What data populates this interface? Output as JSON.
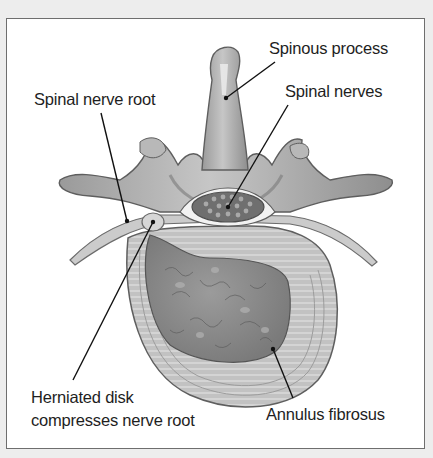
{
  "figure": {
    "labels": {
      "spinous_process": "Spinous process",
      "spinal_nerve_root": "Spinal nerve root",
      "spinal_nerves": "Spinal nerves",
      "herniated_disk_line1": "Herniated disk",
      "herniated_disk_line2": "compresses nerve root",
      "annulus_fibrosus": "Annulus fibrosus"
    }
  },
  "colors": {
    "background": "#ededed",
    "frame_fill": "#ffffff",
    "frame_border": "#6e6e6e",
    "bone": "#a8a8a8",
    "bone_light": "#cfcfcf",
    "disk_nucleus": "#8a8a8a",
    "annulus": "#bdbdbd",
    "leader_line": "#111111"
  }
}
